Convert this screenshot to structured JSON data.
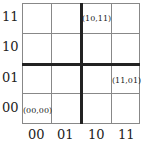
{
  "y_labels": [
    "11",
    "10",
    "01",
    "00"
  ],
  "x_labels": [
    "00",
    "01",
    "10",
    "11"
  ],
  "points": [
    "(10,11)",
    "(11,01)",
    "(00,00)"
  ]
}
